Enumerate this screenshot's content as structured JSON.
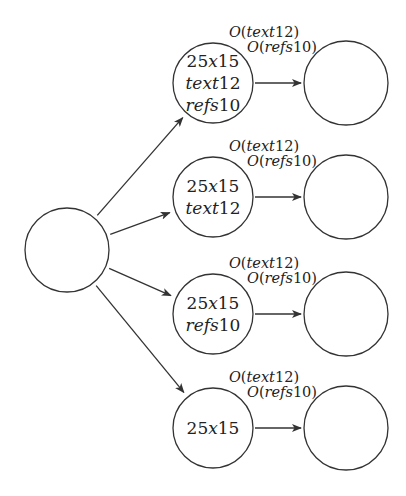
{
  "diagram": {
    "root": {
      "label": ""
    },
    "rows": [
      {
        "middle": {
          "lines": [
            {
              "text": "25x15",
              "style": "mixed"
            },
            {
              "text": "text12",
              "style": "italic"
            },
            {
              "text": "refs10",
              "style": "italic"
            }
          ]
        },
        "annotation": {
          "line1": "O(text12)",
          "line2": "O(refs10)"
        },
        "right": {
          "label": ""
        }
      },
      {
        "middle": {
          "lines": [
            {
              "text": "25x15",
              "style": "mixed"
            },
            {
              "text": "text12",
              "style": "italic"
            }
          ]
        },
        "annotation": {
          "line1": "O(text12)",
          "line2": "O(refs10)"
        },
        "right": {
          "label": ""
        }
      },
      {
        "middle": {
          "lines": [
            {
              "text": "25x15",
              "style": "mixed"
            },
            {
              "text": "refs10",
              "style": "italic"
            }
          ]
        },
        "annotation": {
          "line1": "O(text12)",
          "line2": "O(refs10)"
        },
        "right": {
          "label": ""
        }
      },
      {
        "middle": {
          "lines": [
            {
              "text": "25x15",
              "style": "mixed"
            }
          ]
        },
        "annotation": {
          "line1": "O(text12)",
          "line2": "O(refs10)"
        },
        "right": {
          "label": ""
        }
      }
    ]
  }
}
